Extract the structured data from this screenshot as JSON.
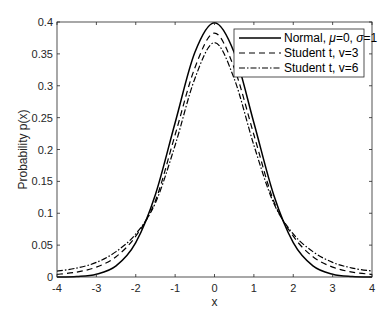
{
  "chart_data": {
    "type": "line",
    "title": "",
    "xlabel": "x",
    "ylabel": "Probability p(x)",
    "xlim": [
      -4,
      4
    ],
    "ylim": [
      0,
      0.4
    ],
    "grid": false,
    "box": true,
    "legend_position": "northeast",
    "x_ticks": [
      -4,
      -3,
      -2,
      -1,
      0,
      1,
      2,
      3,
      4
    ],
    "x_tick_labels": [
      "-4",
      "-3",
      "-2",
      "-1",
      "0",
      "1",
      "2",
      "3",
      "4"
    ],
    "y_ticks": [
      0,
      0.05,
      0.1,
      0.15,
      0.2,
      0.25,
      0.3,
      0.35,
      0.4
    ],
    "y_tick_labels": [
      "0",
      "0.05",
      "0.1",
      "0.15",
      "0.2",
      "0.25",
      "0.3",
      "0.35",
      "0.4"
    ],
    "x": [
      -4,
      -3.5,
      -3,
      -2.5,
      -2,
      -1.5,
      -1,
      -0.5,
      0,
      0.5,
      1,
      1.5,
      2,
      2.5,
      3,
      3.5,
      4
    ],
    "series": [
      {
        "name": "Normal, μ=0, σ=1",
        "style": "solid",
        "values": [
          0.0001,
          0.0009,
          0.0044,
          0.0175,
          0.054,
          0.1295,
          0.242,
          0.3521,
          0.3989,
          0.3521,
          0.242,
          0.1295,
          0.054,
          0.0175,
          0.0044,
          0.0009,
          0.0001
        ]
      },
      {
        "name": "Student t, v=3",
        "style": "dashed",
        "values": [
          0.0041,
          0.0077,
          0.0155,
          0.0318,
          0.064,
          0.1197,
          0.2231,
          0.3279,
          0.3827,
          0.3279,
          0.2231,
          0.1197,
          0.064,
          0.0318,
          0.0155,
          0.0077,
          0.0041
        ]
      },
      {
        "name": "Student t, v=6",
        "style": "dash-dot",
        "values": [
          0.0092,
          0.014,
          0.0229,
          0.0398,
          0.0675,
          0.1163,
          0.2067,
          0.3111,
          0.3676,
          0.3111,
          0.2067,
          0.1163,
          0.0675,
          0.0398,
          0.0229,
          0.014,
          0.0092
        ]
      }
    ]
  },
  "legend": {
    "items": [
      {
        "label_prefix": "Normal, ",
        "mu": "μ",
        "mu_val": "=0, ",
        "sigma": "σ",
        "sigma_val": "=1",
        "style": "solid"
      },
      {
        "label": "Student t, v=3",
        "style": "dashed"
      },
      {
        "label": "Student t, v=6",
        "style": "dash-dot"
      }
    ]
  },
  "colors": {
    "line": "#000000",
    "axis": "#262626",
    "background": "#ffffff"
  }
}
